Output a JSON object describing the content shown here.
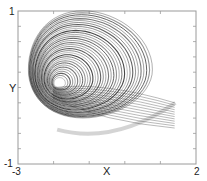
{
  "chart_data": {
    "type": "line",
    "title": "",
    "xlabel": "X",
    "ylabel": "Y",
    "xlim": [
      -3,
      2
    ],
    "ylim": [
      -1,
      1
    ],
    "x_tick_labels": [
      "-3",
      "2"
    ],
    "y_tick_labels": [
      "1",
      "-1"
    ],
    "x_minor_ticks": 5,
    "y_minor_ticks": 10,
    "grid": false,
    "legend": null,
    "spiral_center": {
      "x": -1.85,
      "y": 0.05
    },
    "extent": {
      "x_min": -2.0,
      "x_max": 1.5,
      "y_min": -0.62,
      "y_max": 0.95
    },
    "line_color": "#2a2a2a",
    "fringe_color": "#b8b8b8"
  },
  "frame": {
    "left": 18,
    "top": 11,
    "right": 196,
    "bottom": 164,
    "color": "#9a9a9a"
  }
}
